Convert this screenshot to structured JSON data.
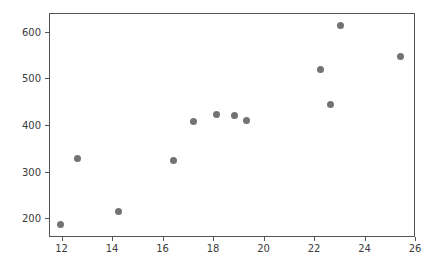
{
  "chart_data": {
    "type": "scatter",
    "title": "",
    "xlabel": "",
    "ylabel": "",
    "xlim": [
      11.5,
      26.0
    ],
    "ylim": [
      160,
      640
    ],
    "grid": false,
    "legend": null,
    "marker": {
      "shape": "circle",
      "color": "#737373",
      "size": 7
    },
    "xticks": [
      12,
      14,
      16,
      18,
      20,
      22,
      24,
      26
    ],
    "xticklabels": [
      "12",
      "14",
      "16",
      "18",
      "20",
      "22",
      "24",
      "26"
    ],
    "yticks": [
      200,
      300,
      400,
      500,
      600
    ],
    "yticklabels": [
      "200",
      "300",
      "400",
      "500",
      "600"
    ],
    "points": [
      {
        "x": 11.9,
        "y": 188
      },
      {
        "x": 12.6,
        "y": 331
      },
      {
        "x": 14.2,
        "y": 216
      },
      {
        "x": 16.4,
        "y": 326
      },
      {
        "x": 17.2,
        "y": 409
      },
      {
        "x": 18.1,
        "y": 424
      },
      {
        "x": 18.8,
        "y": 423
      },
      {
        "x": 19.3,
        "y": 412
      },
      {
        "x": 22.2,
        "y": 521
      },
      {
        "x": 22.6,
        "y": 447
      },
      {
        "x": 23.0,
        "y": 615
      },
      {
        "x": 25.4,
        "y": 548
      }
    ]
  }
}
